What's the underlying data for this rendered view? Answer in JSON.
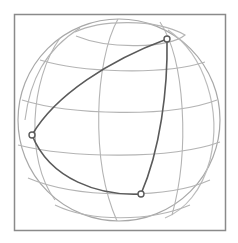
{
  "diagram": {
    "title": "",
    "colors": {
      "background": "#ffffff",
      "frame": "#8a8a8a",
      "grid": "#b4b4b4",
      "outline": "#a8a8a8",
      "triangle": "#5a5a5a",
      "vertex": "#5a5a5a"
    },
    "frame": {
      "x": 14,
      "y": 14,
      "width": 211,
      "height": 216
    },
    "sphere": {
      "cx": 119,
      "cy": 120,
      "r": 101
    },
    "vertices": [
      {
        "id": "A",
        "x": 167,
        "y": 39
      },
      {
        "id": "B",
        "x": 32,
        "y": 135
      },
      {
        "id": "C",
        "x": 141,
        "y": 194
      }
    ],
    "labels": []
  }
}
